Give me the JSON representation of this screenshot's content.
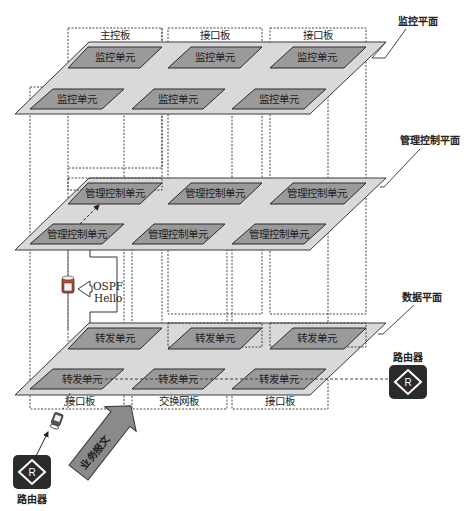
{
  "colors": {
    "plane_fill": "#d9d9d9",
    "plane_stroke": "#3a3a3a",
    "unit_fill": "#9a9a9a",
    "unit_stroke": "#2a2a2a",
    "router_fill": "#2b2b2b",
    "arrow_fill": "#8a8a8a",
    "dotted": "#333333"
  },
  "planes": [
    {
      "id": "monitor",
      "label": "监控平面",
      "y_top": 42,
      "y_bot": 114,
      "label_x": 380,
      "label_y": 22,
      "leader": [
        [
          385,
          28
        ],
        [
          360,
          58
        ],
        [
          345,
          58
        ],
        [
          335,
          61
        ]
      ]
    },
    {
      "id": "management",
      "label": "管理控制平面",
      "y_top": 178,
      "y_bot": 250,
      "label_x": 400,
      "label_y": 142,
      "leader": [
        [
          420,
          148
        ],
        [
          384,
          185
        ],
        [
          380,
          190
        ]
      ]
    },
    {
      "id": "data",
      "label": "数据平面",
      "y_top": 323,
      "y_bot": 395,
      "label_x": 402,
      "label_y": 298,
      "leader": [
        [
          414,
          304
        ],
        [
          383,
          332
        ],
        [
          378,
          334
        ]
      ]
    }
  ],
  "units": {
    "monitor": [
      "监控单元",
      "监控单元",
      "监控单元",
      "监控单元",
      "监控单元",
      "监控单元"
    ],
    "management": [
      "管理控制单元",
      "管理控制单元",
      "管理控制单元",
      "管理控制单元",
      "管理控制单元",
      "管理控制单元"
    ],
    "data": [
      "转发单元",
      "转发单元",
      "转发单元",
      "转发单元",
      "转发单元",
      "转发单元"
    ]
  },
  "boards": {
    "top": [
      {
        "label": "主控板",
        "x": 68,
        "w": 94
      },
      {
        "label": "接口板",
        "x": 168,
        "w": 94
      },
      {
        "label": "接口板",
        "x": 270,
        "w": 96
      }
    ],
    "bottom": [
      {
        "label": "接口板",
        "x": 30,
        "w": 94
      },
      {
        "label": "交换网板",
        "x": 132,
        "w": 95
      },
      {
        "label": "接口板",
        "x": 232,
        "w": 96
      }
    ]
  },
  "ospf": {
    "line1": "OSPF",
    "line2": "Hello"
  },
  "service_packet": {
    "label": "业务报文"
  },
  "routers": [
    {
      "label": "路由器",
      "icon": "R",
      "x": 388,
      "y": 363,
      "label_x": 396,
      "label_y": 357
    },
    {
      "label": "路由器",
      "icon": "R",
      "x": 13,
      "y": 455,
      "label_x": 18,
      "label_y": 502
    }
  ]
}
